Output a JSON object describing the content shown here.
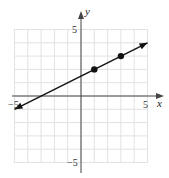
{
  "chart_data": {
    "type": "line",
    "title": "",
    "xlabel": "x",
    "ylabel": "y",
    "xlim": [
      -5,
      5
    ],
    "ylim": [
      -5,
      5
    ],
    "grid": true,
    "grid_step": 1,
    "tick_labels": {
      "x": [
        {
          "value": -5,
          "label": "−5"
        },
        {
          "value": 5,
          "label": "5"
        }
      ],
      "y": [
        {
          "value": 5,
          "label": "5"
        },
        {
          "value": -5,
          "label": "−5"
        }
      ]
    },
    "series": [
      {
        "name": "line",
        "equation": "y = 0.5x + 1.5",
        "x": [
          -5,
          5
        ],
        "y": [
          -1,
          4
        ],
        "arrows_both_ends": true
      }
    ],
    "points": [
      {
        "x": 1,
        "y": 2
      },
      {
        "x": 3,
        "y": 3
      }
    ],
    "colors": {
      "grid": "#e2e2e2",
      "axis": "#444444",
      "line": "#111111"
    }
  }
}
